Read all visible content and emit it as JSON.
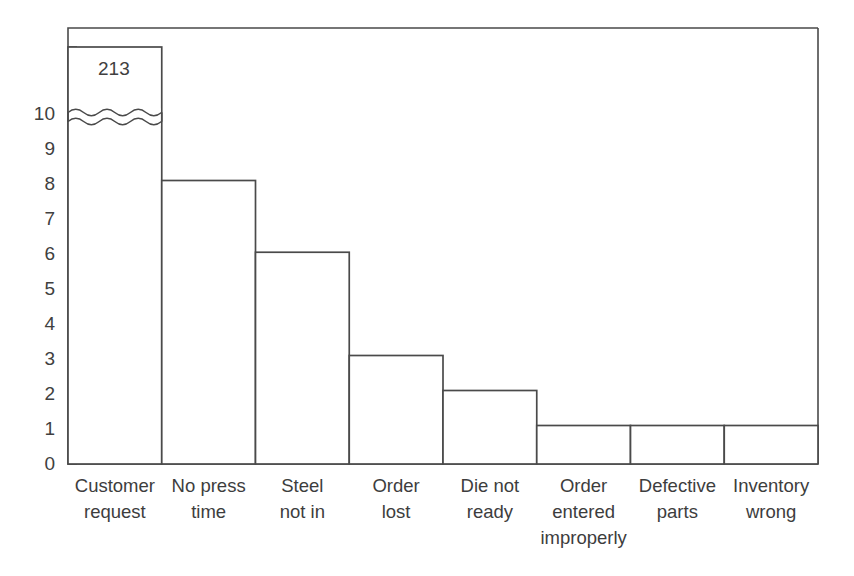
{
  "chart_data": {
    "type": "bar",
    "title": "",
    "subtitle": "",
    "xlabel": "",
    "ylabel": "",
    "categories": [
      "Customer request",
      "No press time",
      "Steel not in",
      "Order lost",
      "Die not ready",
      "Order entered improperly",
      "Defective parts",
      "Inventory wrong"
    ],
    "category_lines": [
      [
        "Customer",
        "request"
      ],
      [
        "No press",
        "time"
      ],
      [
        "Steel",
        "not in"
      ],
      [
        "Order",
        "lost"
      ],
      [
        "Die not",
        "ready"
      ],
      [
        "Order",
        "entered",
        "improperly"
      ],
      [
        "Defective",
        "parts"
      ],
      [
        "Inventory",
        "wrong"
      ]
    ],
    "values": [
      213,
      8.1,
      6.05,
      3.1,
      2.1,
      1.1,
      1.1,
      1.1
    ],
    "data_labels": [
      "213",
      "",
      "",
      "",
      "",
      "",
      "",
      ""
    ],
    "broken_bars": [
      true,
      false,
      false,
      false,
      false,
      false,
      false,
      false
    ],
    "axis_break": true,
    "axis_break_note": "y-axis broken between 10 and 213 on first bar",
    "ytick_labels": [
      "0",
      "1",
      "2",
      "3",
      "4",
      "5",
      "6",
      "7",
      "8",
      "9",
      "10"
    ],
    "ytick_values": [
      0,
      1,
      2,
      3,
      4,
      5,
      6,
      7,
      8,
      9,
      10
    ],
    "unlabeled_ticks_above_break": 2,
    "ylim": [
      0,
      10
    ],
    "grid": false,
    "legend": null,
    "legend_position": "none",
    "bar_fill_color": "#ffffff",
    "bar_outline_color": "#4a4a4a",
    "axis_color": "#4a4a4a",
    "background_color": "#ffffff",
    "text_color": "#3d3d3d"
  }
}
